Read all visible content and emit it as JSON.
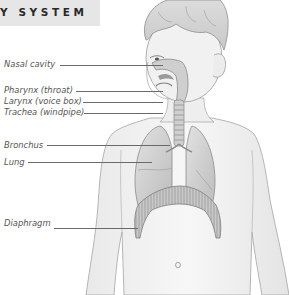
{
  "header": {
    "title": "Y SYSTEM",
    "background": "#e6e6e6",
    "text_color": "#2a2a2a"
  },
  "labels": [
    {
      "id": "nasal-cavity",
      "text": "Nasal cavity",
      "x": 4,
      "y": 59,
      "line_x1": 60,
      "line_x2": 163,
      "line_y": 65
    },
    {
      "id": "pharynx",
      "text": "Pharynx (throat)",
      "x": 4,
      "y": 85,
      "line_x1": 76,
      "line_x2": 163,
      "line_y": 91
    },
    {
      "id": "larynx",
      "text": "Larynx (voice box)",
      "x": 4,
      "y": 96,
      "line_x1": 83,
      "line_x2": 163,
      "line_y": 102
    },
    {
      "id": "trachea",
      "text": "Trachea (windpipe)",
      "x": 4,
      "y": 107,
      "line_x1": 84,
      "line_x2": 163,
      "line_y": 113
    },
    {
      "id": "bronchus",
      "text": "Bronchus",
      "x": 4,
      "y": 140,
      "line_x1": 47,
      "line_x2": 170,
      "line_y": 145
    },
    {
      "id": "lung",
      "text": "Lung",
      "x": 4,
      "y": 157,
      "line_x1": 28,
      "line_x2": 152,
      "line_y": 162
    },
    {
      "id": "diaphragm",
      "text": "Diaphragm",
      "x": 4,
      "y": 218,
      "line_x1": 54,
      "line_x2": 138,
      "line_y": 228
    }
  ],
  "colors": {
    "label_text": "#555555",
    "leader_line": "#6a6a6a",
    "skin": "#f3f3f3",
    "outline": "#9a9a9a",
    "organ": "#d6d6d6",
    "organ_dark": "#a8a8a8"
  }
}
